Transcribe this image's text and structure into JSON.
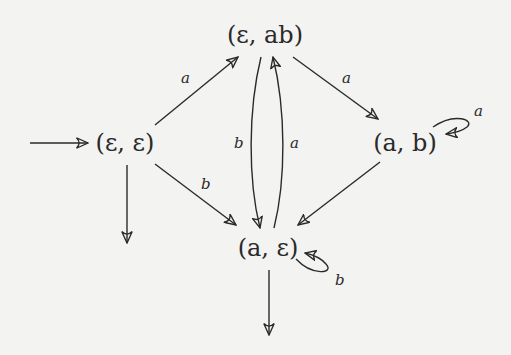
{
  "diagram": {
    "type": "automaton",
    "colors": {
      "ink": "#2a2a2a",
      "background": "#f3f3f1"
    },
    "nodes": [
      {
        "id": "ee",
        "label": "(ε, ε)",
        "x": 125,
        "y": 143,
        "initial": true,
        "final": true
      },
      {
        "id": "eab",
        "label": "(ε, ab)",
        "x": 265,
        "y": 35
      },
      {
        "id": "ab",
        "label": "(a, b)",
        "x": 405,
        "y": 143
      },
      {
        "id": "ae",
        "label": "(a, ε)",
        "x": 268,
        "y": 248,
        "final": true
      }
    ],
    "edges": [
      {
        "from": "ee",
        "to": "eab",
        "label": "a"
      },
      {
        "from": "eab",
        "to": "ab",
        "label": "a"
      },
      {
        "from": "ab",
        "to": "ab",
        "label": "a"
      },
      {
        "from": "ee",
        "to": "ae",
        "label": "b"
      },
      {
        "from": "ab",
        "to": "ae",
        "label": "b"
      },
      {
        "from": "eab",
        "to": "ae",
        "label": "b"
      },
      {
        "from": "ae",
        "to": "eab",
        "label": "a"
      },
      {
        "from": "ae",
        "to": "ae",
        "label": "b"
      }
    ],
    "labels": {
      "node_ee": "(ε, ε)",
      "node_eab": "(ε, ab)",
      "node_ab": "(a, b)",
      "node_ae": "(a, ε)",
      "edge_ee_eab": "a",
      "edge_eab_ab": "a",
      "edge_ab_loop": "a",
      "edge_ee_ae": "b",
      "edge_ab_ae": "b",
      "edge_eab_ae": "b",
      "edge_ae_eab": "a",
      "edge_ae_loop": "b"
    }
  }
}
